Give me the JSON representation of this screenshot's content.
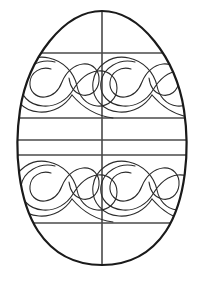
{
  "page": {
    "type": "line-art-coloring-outline",
    "width": 203,
    "height": 285,
    "background_color": "#ffffff"
  },
  "artwork": {
    "subject": "decorated easter egg outline",
    "description": "Oval egg outline divided by one vertical centerline and five horizontal bands, with four mirrored squiggle meander motifs filling the upper and lower quadrants.",
    "outline_color": "#1a1a1a",
    "grid_color": "#4a4a4a",
    "squiggle_color": "#2b2b2b",
    "fill_color": "#ffffff",
    "outline_stroke_width": 2.2,
    "grid_stroke_width": 1.6,
    "squiggle_stroke_width": 1.1
  },
  "egg": {
    "name": "egg-outline",
    "top_y": 11,
    "bottom_y": 265,
    "left_x": 14,
    "right_x": 190,
    "center_x": 102,
    "widest_y": 160,
    "path": "M 102 11 C 140 11 176 58 184 110 C 190 150 186 200 166 231 C 150 255 128 265 102 265 C 76 265 54 255 38 231 C 18 200 14 150 20 110 C 28 58 64 11 102 11 Z"
  },
  "grid": {
    "vertical_lines": [
      {
        "name": "center-vertical-line",
        "x": 102,
        "y1": 11,
        "y2": 265
      }
    ],
    "horizontal_lines": [
      {
        "name": "band-line-top",
        "y": 53,
        "x1": 33,
        "x2": 171
      },
      {
        "name": "band-line-upper-mid",
        "y": 118,
        "x1": 18,
        "x2": 186
      },
      {
        "name": "band-line-mid",
        "y": 140,
        "x1": 16,
        "x2": 188
      },
      {
        "name": "band-line-lower-mid",
        "y": 155,
        "x1": 16,
        "x2": 188
      },
      {
        "name": "band-line-bottom",
        "y": 223,
        "x1": 33,
        "x2": 171
      }
    ]
  },
  "motifs": [
    {
      "name": "squiggle-top-left",
      "quadrant": "top-left",
      "center_x": 62,
      "center_y": 86,
      "rotation": 0,
      "flip_x": false,
      "flip_y": false
    },
    {
      "name": "squiggle-top-right",
      "quadrant": "top-right",
      "center_x": 142,
      "center_y": 86,
      "rotation": 0,
      "flip_x": false,
      "flip_y": false
    },
    {
      "name": "squiggle-bottom-left",
      "quadrant": "bottom-left",
      "center_x": 62,
      "center_y": 190,
      "rotation": 0,
      "flip_x": false,
      "flip_y": false
    },
    {
      "name": "squiggle-bottom-right",
      "quadrant": "bottom-right",
      "center_x": 142,
      "center_y": 190,
      "rotation": 0,
      "flip_x": false,
      "flip_y": false
    }
  ],
  "motif_geometry": {
    "outer_loop": "M 38 -2 C 22 -6 6 4 4 18 C 2 31 12 41 26 42 C 39 43 50 36 56 26 C 62 16 70 8 81 7 C 92 6 100 14 100 24 C 100 35 91 43 80 42 C 69 41 62 32 60 22 C 57 8 46 -3 32 -6 C 14 -10 -2 2 -4 18 C -6 34 6 47 22 48 C 36 49 48 42 55 31",
    "inner_squiggle": "M 34 5 C 24 2 14 8 13 18 C 12 27 19 34 28 33 C 36 32 42 26 45 18 C 49 8 57 1 66 0 C 76 -1 83 7 82 17 C 81 27 73 33 65 31 C 57 29 53 22 52 14",
    "tail": "M 55 31 C 66 44 80 52 96 54"
  },
  "labels": {
    "alt_text": "Black and white outline drawing of an Easter egg with decorative swirl patterns for coloring"
  }
}
